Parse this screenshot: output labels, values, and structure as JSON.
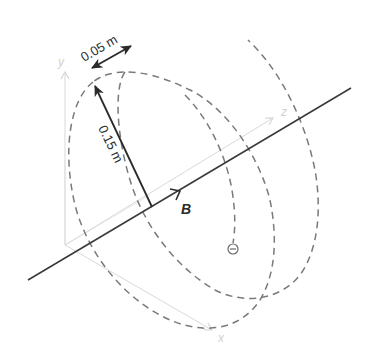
{
  "diagram": {
    "axes": {
      "x_label": "x",
      "y_label": "y",
      "z_label": "z"
    },
    "field": {
      "label": "B"
    },
    "radius_label": "0.15 m",
    "pitch_label": "0.05 m",
    "particle": {
      "symbol": "⊖",
      "name": "electron"
    },
    "colors": {
      "axis": "#d6d6d6",
      "field_line": "#3a3a3a",
      "helix": "#7a7a7a",
      "arrow": "#2a2a2a"
    }
  }
}
